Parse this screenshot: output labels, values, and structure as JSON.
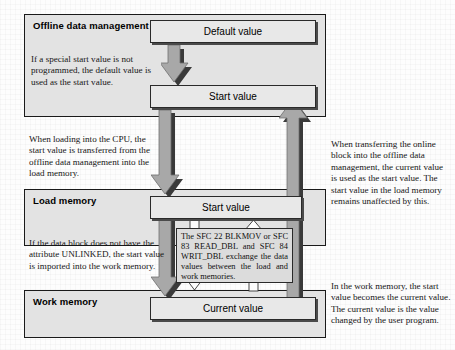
{
  "diagram": {
    "panels": [
      {
        "id": "offline",
        "title": "Offline data management"
      },
      {
        "id": "load",
        "title": "Load memory"
      },
      {
        "id": "work",
        "title": "Work memory"
      }
    ],
    "value_boxes": [
      {
        "id": "default-value",
        "label": "Default value"
      },
      {
        "id": "offline-start-value",
        "label": "Start value"
      },
      {
        "id": "load-start-value",
        "label": "Start value"
      },
      {
        "id": "work-current-value",
        "label": "Current value"
      }
    ],
    "notes": {
      "a": "If a special start value is not programmed, the default value is used as the start value.",
      "b": "When loading into the CPU, the start value is transferred from the offline data management into the load memory.",
      "c": "If the data block does not have the attribute UNLINKED, the start value is imported into the work memory.",
      "d": "When transferring the online block into the offline data management, the current value is used as the start value. The start value in the load memory remains unaffected by this.",
      "e": "In the work memory, the start value becomes the current value. The current value is the value changed by the user program."
    },
    "sfc_callout": "The SFC 22 BLKMOV or SFC 83 READ_DBL and SFC 84 WRIT_DBL exchange the data values between the load and work memories.",
    "bottom_caption": "",
    "arrows": [
      {
        "id": "default-to-start",
        "direction": "down",
        "style": "grey-block",
        "from": "default-value",
        "to": "offline-start-value"
      },
      {
        "id": "offline-to-load",
        "direction": "down",
        "style": "grey-block",
        "from": "offline-start-value",
        "to": "load-start-value"
      },
      {
        "id": "load-to-work",
        "direction": "down",
        "style": "grey-block",
        "from": "load-start-value",
        "to": "work-current-value"
      },
      {
        "id": "work-to-offline",
        "direction": "up",
        "style": "grey-block",
        "from": "work-current-value",
        "to": "offline-start-value"
      },
      {
        "id": "sfc-load-to-work",
        "direction": "down",
        "style": "white-outline",
        "from": "load-start-value",
        "to": "work-current-value"
      },
      {
        "id": "sfc-work-to-load",
        "direction": "up",
        "style": "white-outline",
        "from": "work-current-value",
        "to": "load-start-value"
      }
    ],
    "colors": {
      "panel_fill": "#e3e3e3",
      "value_box_fill": "#e8e8e8",
      "arrow_grey": "#a8a8a8",
      "arrow_shadow": "#3a3a3a",
      "border": "#1a1a1a",
      "page": "#fdfdfd"
    }
  }
}
